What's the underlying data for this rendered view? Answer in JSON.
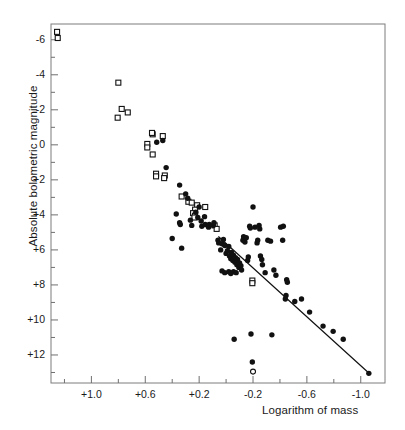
{
  "chart_data": {
    "type": "scatter",
    "title": "",
    "xlabel": "Logarithm of mass",
    "ylabel": "Absolute bolometric magnitude",
    "xlim": [
      1.3,
      -1.18
    ],
    "ylim": [
      -6.9,
      13.6
    ],
    "x_inverted": true,
    "y_inverted": true,
    "grid": false,
    "legend": "none",
    "xticks": [
      1.0,
      0.6,
      0.2,
      -0.2,
      -0.6,
      -1.0
    ],
    "xtick_labels": [
      "+1.0",
      "+0.6",
      "+0.2",
      "-0.2",
      "-0.6",
      "-1.0"
    ],
    "xminor_ticks": [
      1.2,
      0.8,
      0.4,
      0.0,
      -0.4,
      -0.8
    ],
    "yticks": [
      -6,
      -4,
      -2,
      0,
      2,
      4,
      6,
      8,
      10,
      12
    ],
    "ytick_labels": [
      "-6",
      "-4",
      "-2",
      "0",
      "+2",
      "+4",
      "+6",
      "+8",
      "+10",
      "+12"
    ],
    "yminor_ticks": [
      -5,
      -3,
      -1,
      1,
      3,
      5,
      7,
      9,
      11,
      13
    ],
    "series": [
      {
        "name": "open-square-markers",
        "marker": "open-square",
        "color": "#111111",
        "points": [
          [
            1.255,
            -6.45
          ],
          [
            1.25,
            -6.1
          ],
          [
            0.8,
            -3.55
          ],
          [
            0.805,
            -1.55
          ],
          [
            0.73,
            -1.85
          ],
          [
            0.775,
            -2.05
          ],
          [
            0.545,
            0.55
          ],
          [
            0.585,
            -0.05
          ],
          [
            0.585,
            0.15
          ],
          [
            0.47,
            -0.5
          ],
          [
            0.545,
            -0.6
          ],
          [
            0.55,
            -0.68
          ],
          [
            0.52,
            1.65
          ],
          [
            0.455,
            1.75
          ],
          [
            0.46,
            1.9
          ],
          [
            0.52,
            1.8
          ],
          [
            0.33,
            2.95
          ],
          [
            0.28,
            3.25
          ],
          [
            0.255,
            3.3
          ],
          [
            0.215,
            3.45
          ],
          [
            0.23,
            3.7
          ],
          [
            0.245,
            3.9
          ],
          [
            0.23,
            4.05
          ],
          [
            0.235,
            4.15
          ],
          [
            0.155,
            3.55
          ],
          [
            0.085,
            4.6
          ],
          [
            0.07,
            4.8
          ],
          [
            -0.195,
            7.75
          ],
          [
            -0.195,
            7.9
          ]
        ]
      },
      {
        "name": "filled-circle-markers",
        "marker": "filled-circle",
        "color": "#111111",
        "points": [
          [
            0.47,
            -0.25
          ],
          [
            0.515,
            -0.15
          ],
          [
            0.445,
            1.3
          ],
          [
            0.345,
            2.3
          ],
          [
            0.3,
            2.8
          ],
          [
            0.37,
            3.95
          ],
          [
            0.34,
            4.55
          ],
          [
            0.345,
            4.45
          ],
          [
            0.4,
            5.35
          ],
          [
            0.33,
            5.9
          ],
          [
            0.285,
            3.05
          ],
          [
            0.265,
            4.3
          ],
          [
            0.255,
            4.6
          ],
          [
            0.225,
            3.85
          ],
          [
            0.21,
            4.15
          ],
          [
            0.2,
            3.55
          ],
          [
            0.185,
            4.35
          ],
          [
            0.18,
            4.65
          ],
          [
            0.16,
            4.1
          ],
          [
            0.155,
            4.55
          ],
          [
            0.13,
            4.7
          ],
          [
            0.125,
            4.55
          ],
          [
            0.095,
            4.6
          ],
          [
            0.09,
            4.45
          ],
          [
            0.06,
            5.45
          ],
          [
            0.055,
            5.6
          ],
          [
            0.04,
            6.0
          ],
          [
            0.03,
            5.65
          ],
          [
            0.02,
            5.4
          ],
          [
            0.01,
            5.75
          ],
          [
            0.0,
            6.2
          ],
          [
            -0.01,
            6.05
          ],
          [
            -0.02,
            5.8
          ],
          [
            -0.025,
            6.35
          ],
          [
            -0.035,
            6.5
          ],
          [
            -0.04,
            6.15
          ],
          [
            -0.05,
            6.6
          ],
          [
            -0.055,
            6.3
          ],
          [
            -0.065,
            6.7
          ],
          [
            -0.07,
            6.45
          ],
          [
            -0.08,
            6.85
          ],
          [
            -0.085,
            6.55
          ],
          [
            -0.095,
            7.0
          ],
          [
            -0.1,
            6.75
          ],
          [
            -0.11,
            6.9
          ],
          [
            -0.115,
            7.15
          ],
          [
            -0.125,
            5.45
          ],
          [
            -0.13,
            5.25
          ],
          [
            -0.14,
            5.55
          ],
          [
            -0.15,
            5.3
          ],
          [
            -0.16,
            6.6
          ],
          [
            -0.165,
            6.4
          ],
          [
            -0.055,
            7.25
          ],
          [
            -0.075,
            7.3
          ],
          [
            0.03,
            7.2
          ],
          [
            0.01,
            7.3
          ],
          [
            -0.02,
            7.25
          ],
          [
            -0.035,
            7.35
          ],
          [
            -0.175,
            4.65
          ],
          [
            -0.18,
            4.75
          ],
          [
            -0.2,
            3.55
          ],
          [
            -0.215,
            4.7
          ],
          [
            -0.245,
            4.6
          ],
          [
            -0.25,
            4.8
          ],
          [
            -0.23,
            5.6
          ],
          [
            -0.235,
            5.45
          ],
          [
            -0.255,
            6.35
          ],
          [
            -0.265,
            6.55
          ],
          [
            -0.27,
            6.85
          ],
          [
            -0.29,
            7.3
          ],
          [
            -0.31,
            5.45
          ],
          [
            -0.33,
            5.5
          ],
          [
            -0.355,
            7.15
          ],
          [
            -0.37,
            7.45
          ],
          [
            -0.405,
            4.7
          ],
          [
            -0.425,
            4.65
          ],
          [
            -0.42,
            5.45
          ],
          [
            -0.44,
            8.8
          ],
          [
            -0.445,
            8.6
          ],
          [
            -0.45,
            7.7
          ],
          [
            -0.455,
            7.85
          ],
          [
            -0.51,
            8.95
          ],
          [
            -0.56,
            8.8
          ],
          [
            -0.62,
            9.55
          ],
          [
            -0.72,
            10.35
          ],
          [
            -0.795,
            10.65
          ],
          [
            -0.87,
            11.1
          ],
          [
            -0.185,
            10.8
          ],
          [
            -0.34,
            10.85
          ],
          [
            -0.06,
            11.1
          ],
          [
            -0.195,
            12.4
          ],
          [
            -1.06,
            13.05
          ]
        ]
      },
      {
        "name": "open-circle-markers",
        "marker": "open-circle",
        "color": "#111111",
        "points": [
          [
            -0.2,
            12.95
          ]
        ]
      }
    ],
    "fit_line": {
      "name": "mass-luminosity-fit-line",
      "x_start": 0.055,
      "y_start": 5.25,
      "x_end": -1.07,
      "y_end": 13.1,
      "color": "#111111"
    }
  }
}
